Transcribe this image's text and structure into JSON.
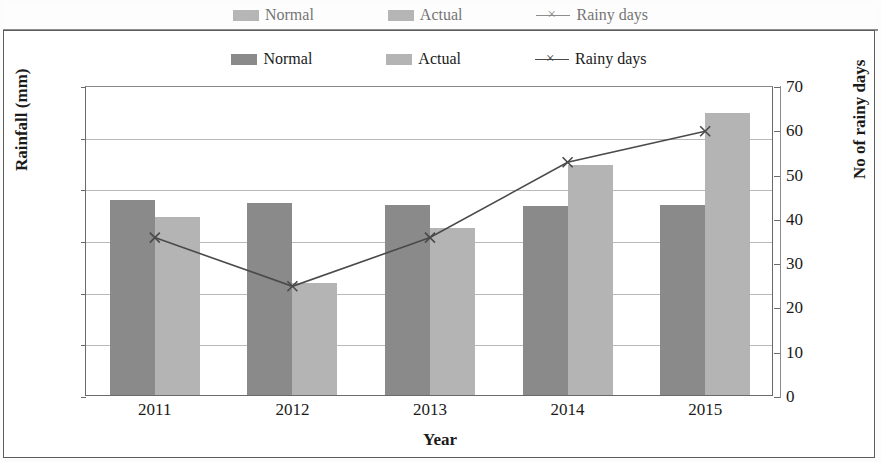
{
  "legend": {
    "items": [
      {
        "label": "Normal",
        "type": "swatch",
        "color": "#8a8a8a",
        "icon": "legend-swatch-normal"
      },
      {
        "label": "Actual",
        "type": "swatch",
        "color": "#b4b4b4",
        "icon": "legend-swatch-actual"
      },
      {
        "label": "Rainy days",
        "type": "line",
        "color": "#4a4a4a",
        "icon": "legend-line-marker-x"
      }
    ]
  },
  "axes": {
    "x_title": "Year",
    "y_left_title": "Rainfall (mm)",
    "y_right_title": "No of rainy days",
    "y_left_ticks": [
      "0",
      "200",
      "400",
      "600",
      "800",
      "1000",
      "1200"
    ],
    "y_right_ticks": [
      "0",
      "10",
      "20",
      "30",
      "40",
      "50",
      "60",
      "70"
    ],
    "x_ticks": [
      "2011",
      "2012",
      "2013",
      "2014",
      "2015"
    ]
  },
  "chart_data": {
    "type": "bar",
    "title": "",
    "xlabel": "Year",
    "ylabel": "Rainfall (mm)",
    "y2label": "No of rainy days",
    "categories": [
      "2011",
      "2012",
      "2013",
      "2014",
      "2015"
    ],
    "ylim": [
      0,
      1200
    ],
    "y2lim": [
      0,
      70
    ],
    "ytick_step": 200,
    "y2tick_step": 10,
    "grid": true,
    "legend_position": "top-center",
    "series": [
      {
        "name": "Normal",
        "type": "bar",
        "axis": "left",
        "color": "#8a8a8a",
        "values": [
          755,
          745,
          735,
          730,
          735
        ]
      },
      {
        "name": "Actual",
        "type": "bar",
        "axis": "left",
        "color": "#b4b4b4",
        "values": [
          690,
          435,
          645,
          890,
          1090
        ]
      },
      {
        "name": "Rainy days",
        "type": "line",
        "axis": "right",
        "color": "#4a4a4a",
        "marker": "x",
        "values": [
          36,
          25,
          36,
          53,
          60
        ]
      }
    ]
  }
}
